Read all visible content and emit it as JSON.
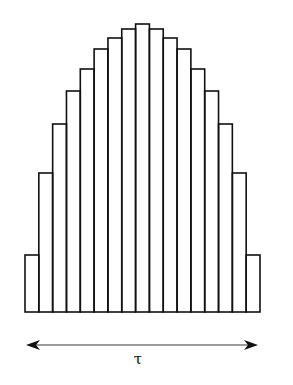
{
  "figure": {
    "colors": {
      "stroke": "#111111",
      "arrow_line": "#7a7a7a",
      "arrow_head": "#111111",
      "background": "#ffffff"
    },
    "baseline_y": 312,
    "left_x": 25,
    "right_x": 260,
    "bar_count": 17,
    "bar_tops_px": [
      255,
      173,
      124,
      91,
      69,
      49,
      38,
      29,
      24,
      29,
      38,
      49,
      69,
      91,
      124,
      173,
      255
    ],
    "arrow": {
      "y": 345,
      "x_start": 26,
      "x_end": 258,
      "label": "τ"
    }
  }
}
